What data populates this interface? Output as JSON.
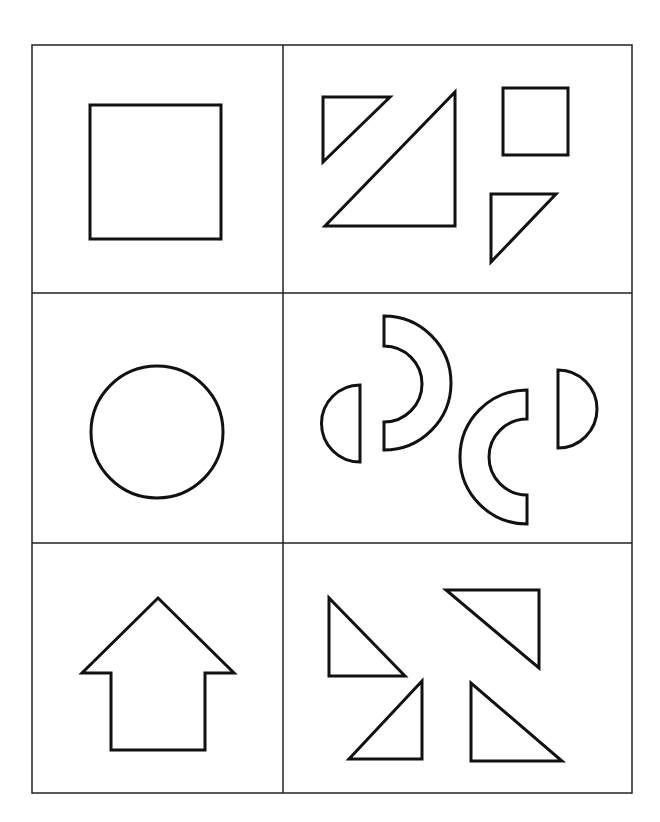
{
  "figure": {
    "colors": {
      "stroke": "#111111",
      "background": "#ffffff",
      "grid": "#222222"
    },
    "grid": {
      "rows": 3,
      "cols": 2
    },
    "rows": [
      {
        "whole_shape": "square",
        "pieces": [
          "small-right-triangle",
          "large-right-triangle",
          "small-square",
          "small-right-triangle"
        ]
      },
      {
        "whole_shape": "circle",
        "pieces": [
          "half-disc",
          "half-ring-arc",
          "half-ring-arc",
          "half-disc"
        ]
      },
      {
        "whole_shape": "up-arrow",
        "pieces": [
          "right-triangle",
          "right-triangle",
          "right-triangle",
          "right-triangle"
        ]
      }
    ]
  }
}
